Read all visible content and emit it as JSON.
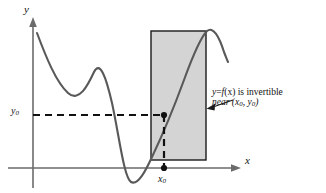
{
  "figure": {
    "title": "",
    "background_color": "#ffffff",
    "width": 326,
    "height": 193
  },
  "axes": {
    "x_label": "x",
    "y_label": "y",
    "axis_color": "#6b6b6b",
    "x_axis_y": 168,
    "y_axis_x": 33
  },
  "ticks": {
    "y0_label": "y",
    "y0_sub": "0",
    "x0_label": "x",
    "x0_sub": "0"
  },
  "annotation": {
    "line1_part1": "y",
    "line1_part2": "=",
    "line1_part3": "f",
    "line1_part4": "(x) is invertible",
    "line2_near": "near",
    "line2_point": "(x",
    "line2_sub1": "0",
    "line2_comma": ", y",
    "line2_sub2": "0",
    "line2_close": ")"
  },
  "region": {
    "name": "shaded-neighborhood-rectangle",
    "fill_color": "#d4d4d4",
    "stroke_color": "#1a1a1a",
    "x": 151,
    "y": 31,
    "width": 55,
    "height": 129
  },
  "curve": {
    "name": "function-graph",
    "color": "#595959",
    "stroke_width": 2.1,
    "description": "y = f(x) cubic-like wave: falls from upper left, local minimum, local maximum, steep descent below x-axis, rises monotonically through the shaded box, peaks and falls at right",
    "path": "M 37,33 C 46,57 56,82 68,93 C 79,103 88,85 94,72 C 100,60 106,77 112,103 C 119,135 124,178 131,182 C 138,186 146,170 152,157 C 162,136 173,110 184,80 C 192,58 200,38 207,31 C 213,26 219,36 224,52 C 226,57 227,60 228,62"
  },
  "markers": {
    "intersection_point": {
      "x": 164,
      "y": 115,
      "radius": 3.1,
      "color": "#111111"
    },
    "x_axis_point": {
      "x": 164,
      "y": 168,
      "radius": 3.1,
      "color": "#111111"
    }
  },
  "dashed_lines": {
    "color": "#111111",
    "dash_pattern": "7 5",
    "horizontal_from_x": 33,
    "horizontal_to_x": 164,
    "horizontal_y": 115,
    "vertical_x": 164,
    "vertical_from_y": 115,
    "vertical_to_y": 168
  },
  "pointer_arrow": {
    "name": "annotation-leader-arrow",
    "color": "#1a1a1a",
    "from_x": 232,
    "from_y": 102,
    "to_x": 208,
    "to_y": 108
  }
}
